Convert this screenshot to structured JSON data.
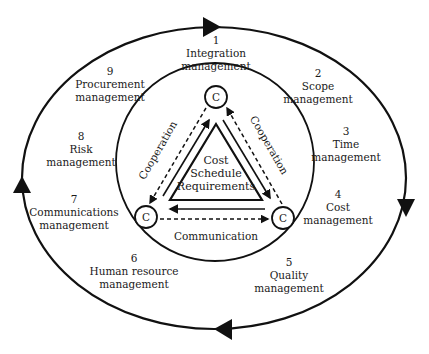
{
  "diagram": {
    "colors": {
      "stroke": "#111111",
      "text": "#1a1a1a",
      "background": "#ffffff"
    },
    "areas": [
      {
        "number": "1",
        "label": "Integration",
        "label2": "management"
      },
      {
        "number": "2",
        "label": "Scope",
        "label2": "management"
      },
      {
        "number": "3",
        "label": "Time",
        "label2": "management"
      },
      {
        "number": "4",
        "label": "Cost",
        "label2": "management"
      },
      {
        "number": "5",
        "label": "Quality",
        "label2": "management"
      },
      {
        "number": "6",
        "label": "Human resource",
        "label2": "management"
      },
      {
        "number": "7",
        "label": "Communications",
        "label2": "management"
      },
      {
        "number": "8",
        "label": "Risk",
        "label2": "management"
      },
      {
        "number": "9",
        "label": "Procurement",
        "label2": "management"
      }
    ],
    "center": {
      "line1": "Cost",
      "line2": "Schedule",
      "line3": "Requirements"
    },
    "nodes": [
      {
        "id": "top",
        "label": "C"
      },
      {
        "id": "bottom-left",
        "label": "C"
      },
      {
        "id": "bottom-right",
        "label": "C"
      }
    ],
    "relations": {
      "left": "Cooperation",
      "right": "Cooperation",
      "bottom": "Communication"
    },
    "outer_cycle": {
      "direction": "clockwise",
      "arrowheads": 4
    }
  }
}
